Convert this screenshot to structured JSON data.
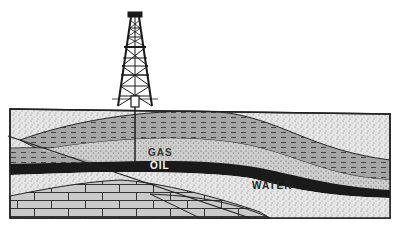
{
  "diagram": {
    "type": "geologic cross-section of an oil trap",
    "labels": {
      "gas": "GAS",
      "oil": "OIL",
      "water": "WATER"
    },
    "elements": [
      "oil derrick",
      "drill pipe",
      "surface sediment layer",
      "shale cap layer (dashed)",
      "gas reservoir sandstone",
      "oil layer",
      "water-bearing sandstone",
      "limestone bedrock (brick pattern)",
      "fault line"
    ],
    "colors": {
      "background": "#ffffff",
      "oil": "#1a1a1a",
      "sand_light": "#e4e4e4",
      "sand_mid": "#cfcfcf",
      "shale": "#9a9a9a",
      "rock": "#c8c8c8",
      "line": "#222222"
    }
  }
}
